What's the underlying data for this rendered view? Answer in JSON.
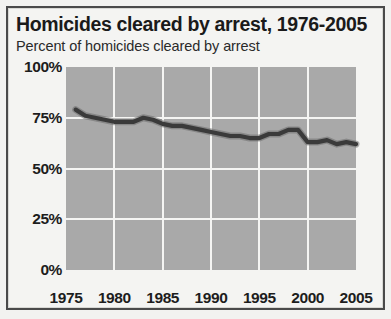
{
  "chart": {
    "title": "Homicides cleared by arrest, 1976-2005",
    "subtitle": "Percent of homicides cleared by arrest"
  },
  "chart_data": {
    "type": "line",
    "title": "Homicides cleared by arrest, 1976-2005",
    "subtitle": "Percent of homicides cleared by arrest",
    "xlabel": "",
    "ylabel": "Percent of homicides cleared by arrest",
    "xlim": [
      1975,
      2005
    ],
    "ylim": [
      0,
      100
    ],
    "xticks": [
      1975,
      1980,
      1985,
      1990,
      1995,
      2000,
      2005
    ],
    "xticklabels": [
      "1975",
      "1980",
      "1985",
      "1990",
      "1995",
      "2000",
      "2005"
    ],
    "yticks": [
      0,
      25,
      50,
      75,
      100
    ],
    "yticklabels": [
      "0%",
      "25%",
      "50%",
      "75%",
      "100%"
    ],
    "grid": true,
    "legend": false,
    "plot_background": "#a9a9a9",
    "line_color": "#3a3a3a",
    "x": [
      1976,
      1977,
      1978,
      1979,
      1980,
      1981,
      1982,
      1983,
      1984,
      1985,
      1986,
      1987,
      1988,
      1989,
      1990,
      1991,
      1992,
      1993,
      1994,
      1995,
      1996,
      1997,
      1998,
      1999,
      2000,
      2001,
      2002,
      2003,
      2004,
      2005
    ],
    "values": [
      79,
      76,
      75,
      74,
      73,
      73,
      73,
      75,
      74,
      72,
      71,
      71,
      70,
      69,
      68,
      67,
      66,
      66,
      65,
      65,
      67,
      67,
      69,
      69,
      63,
      63,
      64,
      62,
      63,
      62
    ],
    "series": [
      {
        "name": "Percent of homicides cleared by arrest",
        "values": [
          79,
          76,
          75,
          74,
          73,
          73,
          73,
          75,
          74,
          72,
          71,
          71,
          70,
          69,
          68,
          67,
          66,
          66,
          65,
          65,
          67,
          67,
          69,
          69,
          63,
          63,
          64,
          62,
          63,
          62
        ]
      }
    ]
  }
}
